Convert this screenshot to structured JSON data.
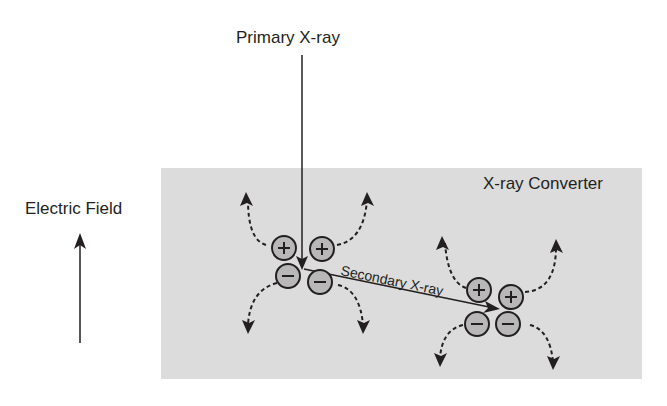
{
  "labels": {
    "primary": "Primary X-ray",
    "electric_field": "Electric Field",
    "converter": "X-ray Converter",
    "secondary": "Secondary X-ray"
  },
  "charges": {
    "plus": "+",
    "minus": "−"
  },
  "colors": {
    "converter_fill": "#dcdcdc",
    "charge_fill": "#b8b8b8",
    "ink": "#231f20"
  }
}
